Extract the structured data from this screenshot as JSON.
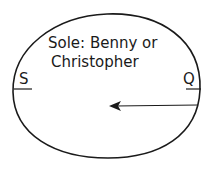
{
  "diagram": {
    "title_line1": "Sole: Benny or",
    "title_line2": "Christopher",
    "left_label": "S",
    "right_label": "Q",
    "arrow": {
      "from": "right edge",
      "to": "center",
      "direction": "left"
    },
    "stroke_color": "#1a1a1a",
    "background": "#ffffff"
  }
}
